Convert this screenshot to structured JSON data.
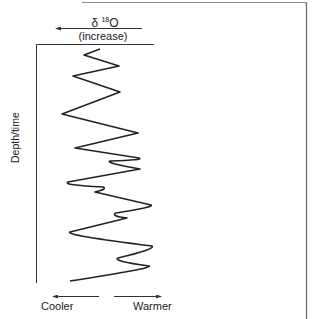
{
  "diagram": {
    "title": {
      "symbol": "δ",
      "isotope_superscript": "18",
      "element": "O",
      "direction_note": "(increase)",
      "arrow_direction": "left"
    },
    "y_axis_label": "Depth/time",
    "bottom_labels": {
      "left": "Cooler",
      "right": "Warmer"
    },
    "colors": {
      "line": "#222222",
      "frame": "#777777",
      "background": "#ffffff"
    },
    "curve_points": [
      [
        100,
        49
      ],
      [
        84,
        55
      ],
      [
        119,
        66
      ],
      [
        73,
        76
      ],
      [
        120,
        92
      ],
      [
        62,
        114
      ],
      [
        138,
        133
      ],
      [
        75,
        148
      ],
      [
        139,
        158
      ],
      [
        110,
        161
      ],
      [
        140,
        169
      ],
      [
        68,
        182
      ],
      [
        103,
        187
      ],
      [
        95,
        192
      ],
      [
        151,
        205
      ],
      [
        116,
        213
      ],
      [
        127,
        218
      ],
      [
        70,
        232
      ],
      [
        152,
        246
      ],
      [
        118,
        258
      ],
      [
        149,
        266
      ],
      [
        70,
        281
      ]
    ]
  }
}
